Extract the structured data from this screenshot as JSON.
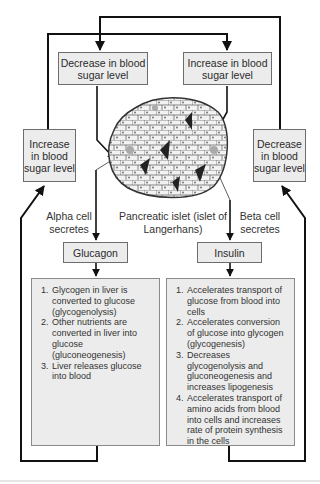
{
  "diagram": {
    "top_left_box": "Decrease in blood sugar level",
    "top_right_box": "Increase in blood sugar level",
    "left_box": "Increase in blood sugar level",
    "right_box": "Decrease in blood sugar level",
    "islet_label": "Pancreatic islet (islet of Langerhans)",
    "alpha_label": "Alpha cell secretes",
    "beta_label": "Beta cell secretes",
    "glucagon": "Glucagon",
    "insulin": "Insulin",
    "glucagon_effects": [
      "Glycogen in liver is converted to glucose (glycogenolysis)",
      "Other nutrients are converted in liver into glucose (gluconeogenesis)",
      "Liver releases glucose into blood"
    ],
    "insulin_effects": [
      "Accelerates transport of glucose from blood into cells",
      "Accelerates conversion of glucose into glycogen (glycogenesis)",
      "Decreases glycogenolysis and gluconeogenesis and increases lipogenesis",
      "Accelerates transport of amino acids from blood into cells and increases rate of protein synthesis in the cells"
    ],
    "colors": {
      "box_fill": "#ececec",
      "line": "#111111",
      "islet_fill": "#d9d9d9"
    }
  }
}
